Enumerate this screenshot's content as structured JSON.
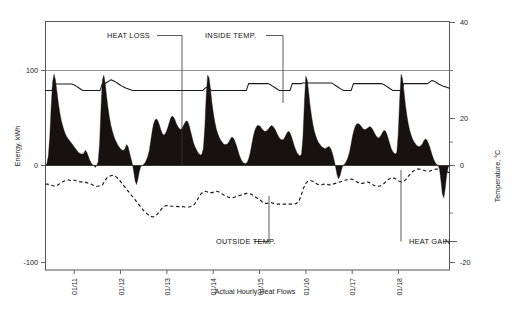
{
  "chart_data": {
    "type": "area",
    "title": "",
    "caption": "Actual Hourly Heat Flows",
    "xlabel": "",
    "ylabel": "Energy, kWh",
    "y2label": "Temperature, °C",
    "grid": true,
    "legend_position": "annotations",
    "ylim": [
      -100,
      140
    ],
    "yticks": [
      100,
      0,
      -100
    ],
    "yticklabels": [
      "100",
      "0",
      "-100"
    ],
    "y2lim": [
      -20,
      40
    ],
    "y2ticks": [
      40,
      20,
      0,
      -20
    ],
    "y2ticklabels": [
      "40",
      "20",
      "0",
      "-20"
    ],
    "y2minorticks": [
      30,
      10,
      -10
    ],
    "xticklabels": [
      "01/11",
      "01/12",
      "01/13",
      "01/14",
      "01/15",
      "01/16",
      "01/17",
      "01/18"
    ],
    "xtickpositions": [
      1,
      2,
      3,
      4,
      5,
      6,
      7,
      8
    ],
    "xlim": [
      0.15,
      8.75
    ],
    "annotations": [
      {
        "name": "heat-loss",
        "text": "HEAT LOSS",
        "x": 155,
        "y": 38
      },
      {
        "name": "inside-temp",
        "text": "INSIDE TEMP.",
        "x": 237,
        "y": 38
      },
      {
        "name": "outside-temp",
        "text": "OUTSIDE TEMP.",
        "x": 252,
        "y": 244
      },
      {
        "name": "heat-gain",
        "text": "HEAT GAIN",
        "x": 441,
        "y": 244
      }
    ],
    "series": [
      {
        "name": "Heat flow",
        "kind": "filled-area",
        "unit": "kWh",
        "description": "Black filled area; positive values are heat loss spikes, negative values are heat gain",
        "values": [
          0,
          2,
          10,
          30,
          62,
          88,
          96,
          90,
          78,
          66,
          56,
          48,
          42,
          37,
          33,
          30,
          28,
          26,
          24,
          22,
          20,
          18,
          16,
          14,
          13,
          12,
          12,
          13,
          16,
          14,
          10,
          6,
          3,
          1,
          0,
          -2,
          0,
          4,
          22,
          60,
          90,
          95,
          86,
          72,
          60,
          50,
          42,
          36,
          31,
          27,
          24,
          21,
          19,
          17,
          16,
          16,
          18,
          22,
          20,
          14,
          8,
          2,
          -6,
          -16,
          -20,
          -14,
          -6,
          -1,
          0,
          1,
          3,
          6,
          10,
          16,
          26,
          36,
          44,
          48,
          49,
          47,
          43,
          38,
          34,
          32,
          33,
          36,
          40,
          45,
          50,
          52,
          51,
          48,
          44,
          41,
          39,
          38,
          39,
          42,
          45,
          47,
          46,
          42,
          36,
          30,
          24,
          20,
          17,
          14,
          12,
          11,
          12,
          18,
          40,
          74,
          95,
          92,
          80,
          66,
          55,
          46,
          39,
          34,
          30,
          27,
          25,
          23,
          22,
          22,
          23,
          25,
          28,
          30,
          29,
          26,
          22,
          17,
          12,
          8,
          5,
          3,
          2,
          2,
          4,
          8,
          14,
          22,
          30,
          36,
          40,
          42,
          42,
          41,
          39,
          37,
          36,
          36,
          37,
          39,
          41,
          42,
          41,
          39,
          36,
          33,
          30,
          28,
          27,
          27,
          29,
          32,
          35,
          36,
          34,
          30,
          25,
          20,
          16,
          13,
          11,
          10,
          12,
          30,
          66,
          94,
          90,
          77,
          63,
          52,
          43,
          36,
          31,
          27,
          24,
          22,
          20,
          19,
          18,
          18,
          19,
          20,
          19,
          16,
          11,
          5,
          -2,
          -10,
          -14,
          -11,
          -5,
          0,
          1,
          3,
          6,
          10,
          16,
          24,
          32,
          38,
          42,
          44,
          44,
          43,
          41,
          39,
          38,
          38,
          39,
          40,
          41,
          40,
          38,
          35,
          32,
          30,
          29,
          30,
          32,
          35,
          37,
          36,
          33,
          28,
          23,
          18,
          15,
          13,
          12,
          14,
          34,
          70,
          96,
          91,
          78,
          64,
          53,
          44,
          37,
          32,
          28,
          25,
          23,
          21,
          20,
          20,
          21,
          23,
          26,
          28,
          27,
          24,
          20,
          15,
          10,
          6,
          3,
          1,
          0,
          -4,
          -16,
          -30,
          -34,
          -24,
          -10,
          -2,
          0
        ]
      },
      {
        "name": "Inside temp.",
        "kind": "line",
        "unit": "°C",
        "description": "Thin solid line near 21-24 °C",
        "values": [
          21.0,
          21.0,
          21.0,
          21.0,
          22.8,
          22.8,
          22.8,
          22.8,
          22.8,
          22.8,
          22.8,
          22.8,
          22.8,
          22.6,
          22.2,
          21.8,
          21.4,
          21.0,
          21.0,
          21.0,
          21.0,
          21.0,
          21.0,
          21.0,
          21.0,
          21.0,
          22.8,
          22.8,
          23.2,
          23.6,
          24.0,
          23.7,
          23.4,
          23.0,
          22.6,
          22.2,
          21.9,
          21.6,
          21.4,
          21.2,
          21.0,
          21.0,
          21.0,
          21.0,
          21.0,
          21.0,
          21.0,
          21.0,
          21.0,
          21.0,
          21.0,
          21.0,
          21.0,
          21.0,
          21.0,
          21.0,
          21.0,
          21.0,
          21.0,
          21.0,
          21.0,
          21.0,
          21.0,
          21.0,
          21.0,
          21.0,
          21.0,
          21.0,
          21.0,
          21.0,
          21.0,
          21.0,
          21.0,
          21.6,
          21.9,
          21.5,
          21.0,
          21.0,
          21.0,
          21.0,
          21.0,
          21.0,
          21.0,
          21.0,
          21.0,
          21.0,
          21.0,
          21.0,
          21.0,
          21.0,
          21.0,
          21.0,
          21.0,
          22.9,
          22.9,
          22.9,
          22.9,
          22.9,
          22.9,
          22.9,
          22.9,
          22.9,
          22.9,
          22.6,
          22.2,
          21.8,
          21.4,
          21.0,
          21.0,
          21.0,
          21.0,
          21.0,
          21.0,
          22.9,
          22.9,
          22.9,
          22.9,
          22.9,
          23.1,
          23.1,
          23.1,
          23.1,
          23.1,
          23.1,
          23.1,
          23.1,
          23.1,
          23.1,
          23.1,
          23.1,
          23.1,
          23.1,
          22.7,
          22.3,
          21.9,
          21.5,
          21.1,
          21.0,
          21.0,
          21.0,
          21.0,
          22.9,
          22.9,
          22.9,
          22.9,
          22.9,
          22.9,
          22.9,
          22.9,
          22.9,
          22.9,
          22.9,
          22.9,
          22.9,
          22.9,
          22.6,
          22.2,
          21.8,
          21.4,
          21.0,
          21.0,
          21.0,
          21.0,
          21.0,
          22.9,
          22.9,
          22.9,
          22.9,
          22.9,
          22.9,
          22.9,
          22.9,
          22.9,
          22.9,
          22.9,
          22.9,
          23.4,
          23.8,
          23.6,
          23.2,
          22.8,
          22.5,
          22.2,
          22.0,
          21.8,
          21.6
        ]
      },
      {
        "name": "Outside temp.",
        "kind": "dashed-line",
        "unit": "°C",
        "description": "Dashed line, roughly -5 to -16 °C, coldest around 01/12-01/13",
        "values": [
          -5.2,
          -5.2,
          -5.4,
          -5.6,
          -5.8,
          -5.6,
          -5.2,
          -4.8,
          -4.4,
          -4.2,
          -4.0,
          -4.2,
          -4.0,
          -4.2,
          -4.4,
          -4.6,
          -4.6,
          -4.6,
          -4.8,
          -5.0,
          -5.2,
          -5.6,
          -5.8,
          -5.8,
          -5.6,
          -5.4,
          -4.2,
          -3.4,
          -3.0,
          -2.8,
          -2.8,
          -3.2,
          -3.8,
          -4.6,
          -5.4,
          -6.2,
          -7.0,
          -7.8,
          -8.6,
          -9.4,
          -10.2,
          -11.0,
          -11.8,
          -12.6,
          -13.2,
          -13.8,
          -14.2,
          -14.4,
          -14.2,
          -13.6,
          -12.8,
          -12.0,
          -11.4,
          -11.2,
          -11.4,
          -11.4,
          -11.4,
          -11.4,
          -11.5,
          -11.5,
          -11.5,
          -11.6,
          -11.6,
          -11.6,
          -11.4,
          -11.0,
          -10.2,
          -9.0,
          -8.0,
          -7.4,
          -7.2,
          -7.4,
          -7.6,
          -7.6,
          -7.4,
          -7.2,
          -7.4,
          -7.8,
          -8.2,
          -8.6,
          -8.8,
          -9.0,
          -9.0,
          -8.8,
          -8.6,
          -8.4,
          -8.2,
          -8.0,
          -7.8,
          -7.8,
          -8.0,
          -8.4,
          -8.8,
          -9.2,
          -9.6,
          -10.2,
          -10.6,
          -10.6,
          -10.4,
          -10.4,
          -10.6,
          -10.8,
          -10.8,
          -10.8,
          -10.8,
          -10.8,
          -10.8,
          -10.8,
          -10.8,
          -10.8,
          -10.6,
          -10.0,
          -8.4,
          -6.4,
          -5.0,
          -4.4,
          -4.2,
          -4.4,
          -4.8,
          -5.2,
          -5.4,
          -5.4,
          -5.2,
          -5.2,
          -5.4,
          -5.4,
          -5.2,
          -5.0,
          -4.8,
          -4.6,
          -4.4,
          -4.2,
          -4.0,
          -3.8,
          -3.8,
          -4.0,
          -4.4,
          -4.8,
          -5.0,
          -5.0,
          -4.8,
          -4.6,
          -4.8,
          -5.2,
          -5.6,
          -5.8,
          -5.8,
          -5.6,
          -5.2,
          -4.6,
          -4.0,
          -3.6,
          -3.4,
          -3.6,
          -4.0,
          -4.4,
          -4.6,
          -4.4,
          -3.8,
          -3.0,
          -2.2,
          -1.6,
          -1.2,
          -1.0,
          -1.0,
          -1.2,
          -1.4,
          -1.6,
          -1.6,
          -1.4,
          -1.2,
          -1.0,
          -1.0,
          -1.2,
          -1.4,
          -1.6,
          -1.8,
          -2.0
        ]
      }
    ]
  }
}
